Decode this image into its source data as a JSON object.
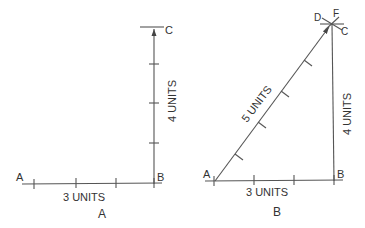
{
  "figure_a": {
    "caption": "A",
    "point_labels": {
      "a": "A",
      "b": "B",
      "c": "C"
    },
    "horizontal_label": "3 UNITS",
    "vertical_label": "4 UNITS"
  },
  "figure_b": {
    "caption": "B",
    "point_labels": {
      "a": "A",
      "b": "B",
      "c": "C",
      "d": "D",
      "f": "F"
    },
    "horizontal_label": "3 UNITS",
    "vertical_label": "4 UNITS",
    "hypotenuse_label": "5 UNITS"
  },
  "colors": {
    "line": "#555555",
    "text": "#333333"
  }
}
